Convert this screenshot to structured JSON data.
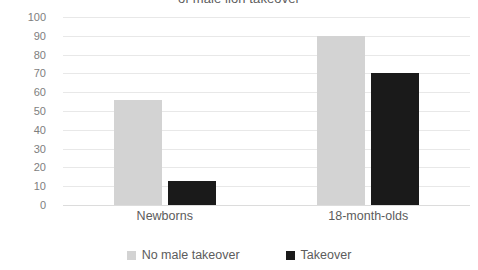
{
  "chart_data": {
    "type": "bar",
    "title": "of male lion takeover",
    "title_clipped": true,
    "xlabel": "",
    "ylabel": "",
    "categories": [
      "Newborns",
      "18-month-olds"
    ],
    "series": [
      {
        "name": "No male takeover",
        "color": "#d3d3d3",
        "values": [
          56,
          90
        ]
      },
      {
        "name": "Takeover",
        "color": "#1a1a1a",
        "values": [
          13,
          70
        ]
      }
    ],
    "ylim": [
      0,
      100
    ],
    "ytick_step": 10,
    "yticks": [
      0,
      10,
      20,
      30,
      40,
      50,
      60,
      70,
      80,
      90,
      100
    ],
    "grid": true,
    "grid_axis": "y",
    "legend_position": "bottom-center",
    "background": "#ffffff",
    "grid_color": "#e8e8e8",
    "text_color": "#5c5c5c"
  }
}
